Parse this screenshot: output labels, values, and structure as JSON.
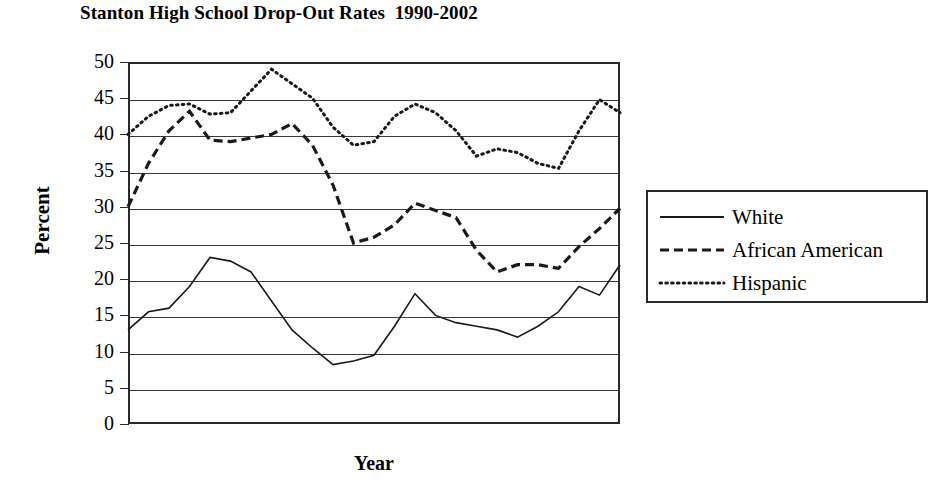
{
  "chart_data": {
    "type": "line",
    "title": "Stanton High School Drop-Out Rates  1990-2002",
    "xlabel": "Year",
    "ylabel": "Percent",
    "ylim": [
      0,
      50
    ],
    "ytick_labels": [
      "50",
      "45",
      "40",
      "35",
      "30",
      "25",
      "20",
      "15",
      "10",
      "5",
      "0"
    ],
    "ytick_values": [
      50,
      45,
      40,
      35,
      30,
      25,
      20,
      15,
      10,
      5,
      0
    ],
    "xlim": [
      1990,
      2002
    ],
    "xtick_labels": [],
    "grid": "horizontal",
    "legend_position": "right",
    "x": [
      1990,
      1990.5,
      1991,
      1991.5,
      1992,
      1992.5,
      1993,
      1993.5,
      1994,
      1994.5,
      1995,
      1995.5,
      1996,
      1996.5,
      1997,
      1997.5,
      1998,
      1998.5,
      1999,
      1999.5,
      2000,
      2000.5,
      2001,
      2001.5,
      2002
    ],
    "series": [
      {
        "name": "White",
        "style": "solid",
        "color": "#1a1a1a",
        "values": [
          13,
          15.5,
          16,
          19,
          23,
          22.5,
          21,
          17,
          13,
          10.5,
          8.2,
          8.7,
          9.5,
          13.5,
          18,
          15,
          14,
          13.5,
          13,
          12,
          13.5,
          15.5,
          19,
          17.8,
          22
        ]
      },
      {
        "name": "African American",
        "style": "dashed",
        "color": "#1a1a1a",
        "values": [
          30,
          36,
          40.5,
          43.2,
          39.2,
          39,
          39.5,
          40,
          41.5,
          38.5,
          33,
          25,
          25.8,
          27.5,
          30.5,
          29.5,
          28.5,
          24,
          21,
          22,
          22,
          21.5,
          24.5,
          27,
          29.8
        ]
      },
      {
        "name": "Hispanic",
        "style": "dotted",
        "color": "#1a1a1a",
        "values": [
          40,
          42.5,
          44,
          44.2,
          42.8,
          43,
          46,
          49,
          47,
          45,
          41,
          38.5,
          39,
          42.5,
          44.2,
          43,
          40.5,
          37,
          38,
          37.5,
          36,
          35.3,
          40.5,
          44.8,
          43
        ]
      }
    ]
  },
  "legend": {
    "entries": [
      {
        "label": "White",
        "style": "solid"
      },
      {
        "label": "African American",
        "style": "dashed"
      },
      {
        "label": "Hispanic",
        "style": "dotted"
      }
    ]
  }
}
